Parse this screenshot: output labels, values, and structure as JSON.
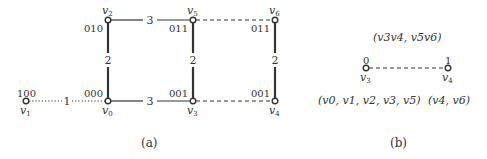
{
  "figure_a": {
    "caption": "(a)",
    "nodes": [
      {
        "id": "v0",
        "name": "v",
        "sub": "0",
        "code": "000",
        "x": 108,
        "y": 101
      },
      {
        "id": "v1",
        "name": "v",
        "sub": "1",
        "code": "100",
        "x": 26,
        "y": 101
      },
      {
        "id": "v2",
        "name": "v",
        "sub": "2",
        "code": "010",
        "x": 108,
        "y": 20
      },
      {
        "id": "v3",
        "name": "v",
        "sub": "3",
        "code": "001",
        "x": 193,
        "y": 101
      },
      {
        "id": "v4",
        "name": "v",
        "sub": "4",
        "code": "001",
        "x": 275,
        "y": 101
      },
      {
        "id": "v5",
        "name": "v",
        "sub": "5",
        "code": "011",
        "x": 193,
        "y": 20
      },
      {
        "id": "v6",
        "name": "v",
        "sub": "6",
        "code": "011",
        "x": 275,
        "y": 20
      }
    ],
    "edges": [
      {
        "from": "v1",
        "to": "v0",
        "weight": "1",
        "style": "dotted"
      },
      {
        "from": "v0",
        "to": "v2",
        "weight": "2",
        "style": "solid"
      },
      {
        "from": "v0",
        "to": "v3",
        "weight": "3",
        "style": "solid"
      },
      {
        "from": "v2",
        "to": "v5",
        "weight": "3",
        "style": "solid"
      },
      {
        "from": "v3",
        "to": "v5",
        "weight": "2",
        "style": "solid"
      },
      {
        "from": "v4",
        "to": "v6",
        "weight": "2",
        "style": "solid"
      },
      {
        "from": "v5",
        "to": "v6",
        "weight": "",
        "style": "dashed"
      },
      {
        "from": "v3",
        "to": "v4",
        "weight": "",
        "style": "dashed"
      }
    ]
  },
  "figure_b": {
    "caption": "(b)",
    "top_label": "(v3v4,  v5v6)",
    "nodes": [
      {
        "id": "v3",
        "name": "v",
        "sub": "3",
        "code": "0",
        "group": "(v0, v1, v2, v3, v5)"
      },
      {
        "id": "v4",
        "name": "v",
        "sub": "4",
        "code": "1",
        "group": "(v4, v6)"
      }
    ],
    "edge_style": "dashed"
  },
  "colors": {
    "stroke": "#333333",
    "background": "#ffffff"
  }
}
